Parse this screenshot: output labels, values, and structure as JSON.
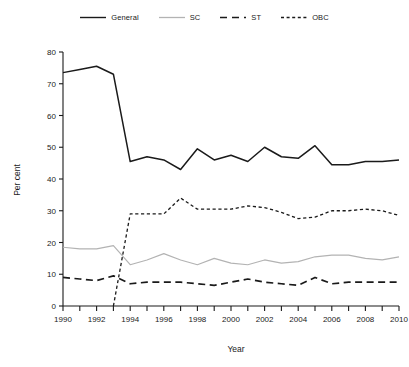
{
  "legend": {
    "position": "top-center",
    "entries": [
      {
        "label": "General",
        "style": "solid",
        "color": "#1a1a1a",
        "icon": "line-solid-icon"
      },
      {
        "label": "SC",
        "style": "solid-light",
        "color": "#b3b3b3",
        "icon": "line-solid-light-icon"
      },
      {
        "label": "ST",
        "style": "dashed",
        "color": "#1a1a1a",
        "icon": "line-dashed-icon"
      },
      {
        "label": "OBC",
        "style": "dotted",
        "color": "#1a1a1a",
        "icon": "line-dotted-icon"
      }
    ]
  },
  "axes": {
    "x_title": "Year",
    "y_title": "Per cent",
    "x_tick_labels": [
      "1990",
      "1992",
      "1994",
      "1996",
      "1998",
      "2000",
      "2002",
      "2004",
      "2006",
      "2008",
      "2010"
    ],
    "y_tick_labels": [
      "0",
      "10",
      "20",
      "30",
      "40",
      "50",
      "60",
      "70",
      "80"
    ]
  },
  "chart_data": {
    "type": "line",
    "title": "",
    "subtitle": "",
    "xlabel": "Year",
    "ylabel": "Per cent",
    "xlim": [
      1990,
      2010
    ],
    "ylim": [
      0,
      80
    ],
    "x_tick_step": 1,
    "x_labeled_tick_step": 2,
    "y_tick_step": 10,
    "grid": false,
    "legend_position": "top-center",
    "x": [
      1990,
      1991,
      1992,
      1993,
      1994,
      1995,
      1996,
      1997,
      1998,
      1999,
      2000,
      2001,
      2002,
      2003,
      2004,
      2005,
      2006,
      2007,
      2008,
      2009,
      2010
    ],
    "series": [
      {
        "name": "General",
        "style": "solid",
        "color": "#1a1a1a",
        "values": [
          73.5,
          74.5,
          75.5,
          73.0,
          45.5,
          47.0,
          46.0,
          43.0,
          49.5,
          46.0,
          47.5,
          45.5,
          50.0,
          47.0,
          46.5,
          50.5,
          44.5,
          44.5,
          45.5,
          45.5,
          46.0
        ]
      },
      {
        "name": "SC",
        "style": "solid-light",
        "color": "#b3b3b3",
        "values": [
          18.5,
          18.0,
          18.0,
          19.0,
          13.0,
          14.5,
          16.5,
          14.5,
          13.0,
          15.0,
          13.5,
          13.0,
          14.5,
          13.5,
          14.0,
          15.5,
          16.0,
          16.0,
          15.0,
          14.5,
          15.5
        ]
      },
      {
        "name": "ST",
        "style": "dashed",
        "color": "#1a1a1a",
        "values": [
          9.0,
          8.5,
          8.0,
          9.5,
          7.0,
          7.5,
          7.5,
          7.5,
          7.0,
          6.5,
          7.5,
          8.5,
          7.5,
          7.0,
          6.5,
          9.0,
          7.0,
          7.5,
          7.5,
          7.5,
          7.5
        ]
      },
      {
        "name": "OBC",
        "style": "dotted",
        "color": "#1a1a1a",
        "values": [
          null,
          null,
          null,
          0.0,
          29.0,
          29.0,
          29.0,
          34.0,
          30.5,
          30.5,
          30.5,
          31.5,
          31.0,
          29.5,
          27.5,
          28.0,
          30.0,
          30.0,
          30.5,
          30.0,
          28.5
        ]
      }
    ]
  }
}
